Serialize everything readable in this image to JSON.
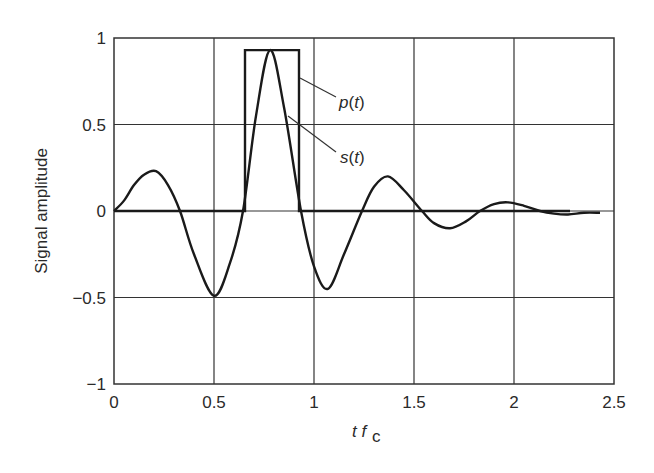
{
  "chart_data": {
    "type": "line",
    "title": "",
    "xlabel": "t f_c",
    "ylabel": "Signal amplitude",
    "xlim": [
      0,
      2.5
    ],
    "ylim": [
      -1,
      1
    ],
    "xticks": [
      "0",
      "0.5",
      "1",
      "1.5",
      "2",
      "2.5"
    ],
    "yticks": [
      "1",
      "0.5",
      "0",
      "−0.5",
      "−1"
    ],
    "grid": true,
    "legend": "annotations",
    "annotations": [
      {
        "text": "p(t)",
        "points_to": "rectangular pulse right edge",
        "x": 1.12,
        "y": 0.66
      },
      {
        "text": "s(t)",
        "points_to": "pulse-shaped sinusoid",
        "x": 1.12,
        "y": 0.29
      }
    ],
    "series": [
      {
        "name": "s(t)",
        "x": [
          0,
          0.05,
          0.1,
          0.15,
          0.21,
          0.27,
          0.33,
          0.4,
          0.5,
          0.58,
          0.645,
          0.71,
          0.78,
          0.85,
          0.935,
          1.0,
          1.07,
          1.15,
          1.24,
          1.3,
          1.37,
          1.45,
          1.54,
          1.6,
          1.68,
          1.76,
          1.83,
          1.9,
          1.97,
          2.05,
          2.13,
          2.2,
          2.27,
          2.35,
          2.43
        ],
        "values": [
          0,
          0.06,
          0.15,
          0.21,
          0.23,
          0.15,
          0,
          -0.25,
          -0.49,
          -0.3,
          0,
          0.55,
          0.93,
          0.6,
          0,
          -0.32,
          -0.45,
          -0.25,
          0,
          0.14,
          0.2,
          0.12,
          0,
          -0.07,
          -0.1,
          -0.06,
          0,
          0.04,
          0.05,
          0.03,
          0,
          -0.015,
          -0.02,
          -0.01,
          -0.01
        ]
      },
      {
        "name": "p(t)",
        "x": [
          0,
          0.655,
          0.655,
          0.925,
          0.925,
          2.28
        ],
        "values": [
          0,
          0,
          0.93,
          0.93,
          0,
          0
        ]
      }
    ]
  }
}
